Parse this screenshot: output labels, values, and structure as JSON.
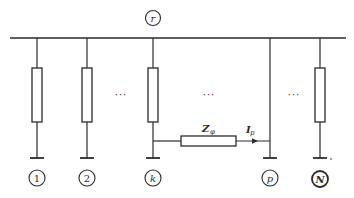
{
  "diagram": {
    "bus_node": {
      "label": "r"
    },
    "nodes": [
      {
        "id": "1",
        "label": "1",
        "x": 37,
        "style": "normal"
      },
      {
        "id": "2",
        "label": "2",
        "x": 87,
        "style": "normal"
      },
      {
        "id": "k",
        "label": "k",
        "x": 153,
        "style": "italic"
      },
      {
        "id": "p",
        "label": "p",
        "x": 270,
        "style": "italic"
      },
      {
        "id": "N",
        "label": "N",
        "x": 320,
        "style": "italic-bold"
      }
    ],
    "ellipses": [
      "···",
      "···",
      "···"
    ],
    "branch": {
      "from": "k",
      "to": "p",
      "impedance_symbol": "Z",
      "impedance_subscript": "φ",
      "current_symbol": "I",
      "current_subscript": "p"
    },
    "colors": {
      "line": "#2a2a2a",
      "background": "#ffffff"
    }
  }
}
